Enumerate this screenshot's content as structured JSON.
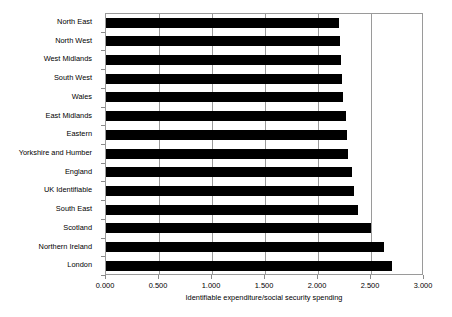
{
  "chart_data": {
    "type": "bar",
    "orientation": "horizontal",
    "title": "",
    "xlabel": "Identifiable expenditure/social security spending",
    "ylabel": "",
    "xlim": [
      0.0,
      3.0
    ],
    "xticks": [
      "0.000",
      "0.500",
      "1.000",
      "1.500",
      "2.000",
      "2.500",
      "3.000"
    ],
    "xtick_values": [
      0.0,
      0.5,
      1.0,
      1.5,
      2.0,
      2.5,
      3.0
    ],
    "grid": "vertical",
    "legend": "none",
    "bar_color": "#000000",
    "categories": [
      "North East",
      "North West",
      "West Midlands",
      "South West",
      "Wales",
      "East Midlands",
      "Eastern",
      "Yorkshire and Humber",
      "England",
      "UK Identifiable",
      "South East",
      "Scotland",
      "Northern Ireland",
      "London"
    ],
    "values": [
      2.2,
      2.21,
      2.22,
      2.23,
      2.24,
      2.26,
      2.27,
      2.28,
      2.32,
      2.34,
      2.38,
      2.5,
      2.62,
      2.7
    ]
  },
  "axis": {
    "title": "Identifiable expenditure/social security spending"
  },
  "colors": {
    "bar": "#000000",
    "frame": "#9a9a9a",
    "grid": "#9a9a9a",
    "background": "#ffffff",
    "text": "#000000"
  }
}
